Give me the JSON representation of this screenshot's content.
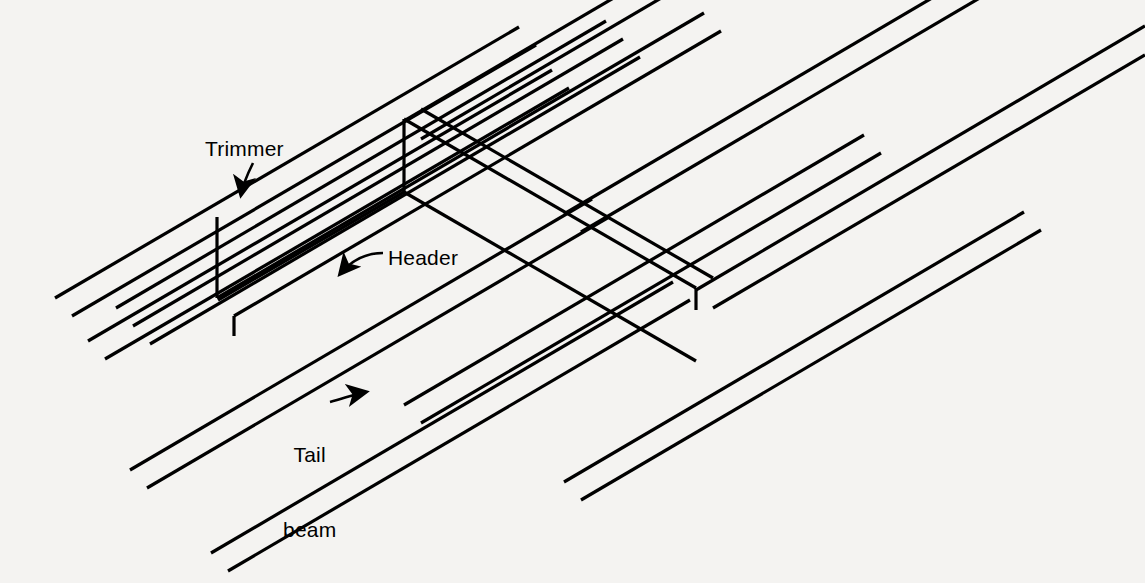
{
  "figure": {
    "type": "isometric-line-drawing",
    "background_color": "#f4f3f1",
    "line_color": "#000000",
    "label_color": "#000000"
  },
  "labels": [
    {
      "id": "trimmer",
      "text": "Trimmer",
      "x": 205,
      "y": 136,
      "leader": "curved-arrow-down-left",
      "points_to": "trimmer-joist"
    },
    {
      "id": "header",
      "text": "Header",
      "x": 388,
      "y": 245,
      "leader": "curved-arrow-down-left",
      "points_to": "header-beam"
    },
    {
      "id": "tail_beam",
      "text": "Tail\nbeam",
      "line1": "Tail",
      "line2": "beam",
      "x": 283,
      "y": 392,
      "leader": "curved-arrow-right",
      "points_to": "tail-beam-joist"
    }
  ],
  "members": {
    "joists": "parallel full-length floor joists running lower-left to upper-right",
    "trimmer": "doubled joist bounding the side of the opening",
    "header": "short beam spanning between trimmers across the opening",
    "tail_beam": "shortened joist framing into the header"
  }
}
